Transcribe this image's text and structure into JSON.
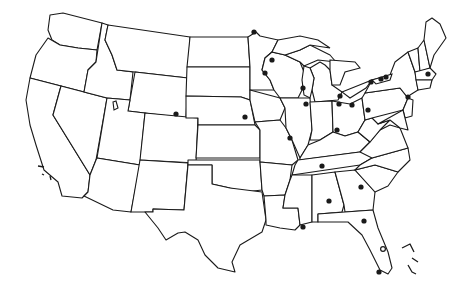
{
  "map": {
    "title": "",
    "region": "Contiguous United States",
    "style": {
      "line_color": "#1a1a1a",
      "background": "#ffffff",
      "dot_color": "#1a1a1a"
    },
    "markers": [
      {
        "id": "duluth",
        "x": 254,
        "y": 32,
        "type": "filled"
      },
      {
        "id": "green-bay",
        "x": 272,
        "y": 60,
        "type": "filled"
      },
      {
        "id": "minneapolis",
        "x": 265,
        "y": 73,
        "type": "filled"
      },
      {
        "id": "milwaukee",
        "x": 303,
        "y": 88,
        "type": "filled"
      },
      {
        "id": "chicago",
        "x": 306,
        "y": 104,
        "type": "filled"
      },
      {
        "id": "detroit",
        "x": 340,
        "y": 96,
        "type": "filled"
      },
      {
        "id": "toledo",
        "x": 339,
        "y": 104,
        "type": "filled"
      },
      {
        "id": "cleveland",
        "x": 352,
        "y": 105,
        "type": "filled"
      },
      {
        "id": "buffalo",
        "x": 371,
        "y": 82,
        "type": "filled"
      },
      {
        "id": "rochester",
        "x": 381,
        "y": 79,
        "type": "filled"
      },
      {
        "id": "syracuse",
        "x": 386,
        "y": 77,
        "type": "filled"
      },
      {
        "id": "boston",
        "x": 428,
        "y": 74,
        "type": "filled"
      },
      {
        "id": "new-york",
        "x": 408,
        "y": 97,
        "type": "filled"
      },
      {
        "id": "pittsburgh",
        "x": 368,
        "y": 110,
        "type": "filled"
      },
      {
        "id": "cincinnati",
        "x": 337,
        "y": 130,
        "type": "filled"
      },
      {
        "id": "st-louis",
        "x": 290,
        "y": 138,
        "type": "filled"
      },
      {
        "id": "omaha",
        "x": 245,
        "y": 117,
        "type": "filled"
      },
      {
        "id": "denver",
        "x": 176,
        "y": 114,
        "type": "filled"
      },
      {
        "id": "nashville",
        "x": 322,
        "y": 166,
        "type": "filled"
      },
      {
        "id": "atlanta",
        "x": 361,
        "y": 187,
        "type": "filled"
      },
      {
        "id": "birmingham",
        "x": 329,
        "y": 201,
        "type": "filled"
      },
      {
        "id": "mobile",
        "x": 303,
        "y": 227,
        "type": "filled"
      },
      {
        "id": "jacksonville",
        "x": 364,
        "y": 221,
        "type": "filled"
      },
      {
        "id": "orlando",
        "x": 383,
        "y": 249,
        "type": "open"
      },
      {
        "id": "miami",
        "x": 379,
        "y": 272,
        "type": "filled"
      }
    ]
  }
}
